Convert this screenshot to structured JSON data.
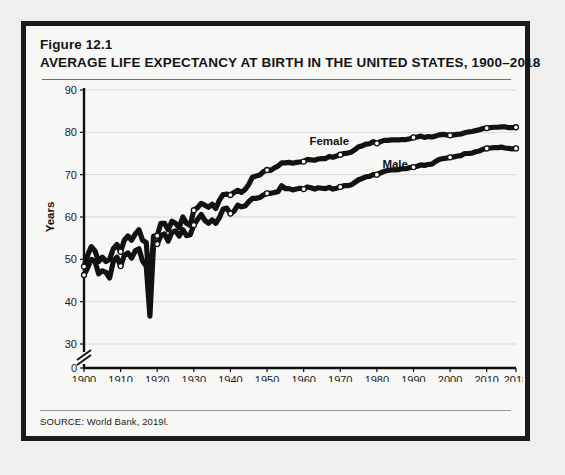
{
  "figure": {
    "number": "Figure 12.1",
    "title": "AVERAGE LIFE EXPECTANCY AT BIRTH IN THE UNITED STATES, 1900–2018",
    "source": "SOURCE: World Bank, 2019l.",
    "border_color": "#1b1b1b",
    "background_color": "#f7f7f6"
  },
  "chart_data": {
    "type": "line",
    "title": "AVERAGE LIFE EXPECTANCY AT BIRTH IN THE UNITED STATES, 1900–2018",
    "xlabel": "",
    "ylabel": "Years",
    "xlim": [
      1900,
      2018
    ],
    "ylim": [
      30,
      90
    ],
    "y_axis_break": true,
    "y_break_between": [
      0,
      30
    ],
    "grid": "horizontal",
    "legend": "inline-labels",
    "line_color": "#121212",
    "marker_color": "#ffffff",
    "xticks": [
      1900,
      1910,
      1920,
      1930,
      1940,
      1950,
      1960,
      1970,
      1980,
      1990,
      2000,
      2010,
      2018
    ],
    "xtick_labels": [
      "1900",
      "1910",
      "1920",
      "1930",
      "1940",
      "1950",
      "1960",
      "1970",
      "1980",
      "1990",
      "2000",
      "2010",
      "2018"
    ],
    "yticks": [
      0,
      30,
      40,
      50,
      60,
      70,
      80,
      90
    ],
    "ytick_labels": [
      "0",
      "30",
      "40",
      "50",
      "60",
      "70",
      "80",
      "90"
    ],
    "x": [
      1900,
      1901,
      1902,
      1903,
      1904,
      1905,
      1906,
      1907,
      1908,
      1909,
      1910,
      1911,
      1912,
      1913,
      1914,
      1915,
      1916,
      1917,
      1918,
      1919,
      1920,
      1921,
      1922,
      1923,
      1924,
      1925,
      1926,
      1927,
      1928,
      1929,
      1930,
      1931,
      1932,
      1933,
      1934,
      1935,
      1936,
      1937,
      1938,
      1939,
      1940,
      1941,
      1942,
      1943,
      1944,
      1945,
      1946,
      1947,
      1948,
      1949,
      1950,
      1951,
      1952,
      1953,
      1954,
      1955,
      1956,
      1957,
      1958,
      1959,
      1960,
      1961,
      1962,
      1963,
      1964,
      1965,
      1966,
      1967,
      1968,
      1969,
      1970,
      1971,
      1972,
      1973,
      1974,
      1975,
      1976,
      1977,
      1978,
      1979,
      1980,
      1981,
      1982,
      1983,
      1984,
      1985,
      1986,
      1987,
      1988,
      1989,
      1990,
      1991,
      1992,
      1993,
      1994,
      1995,
      1996,
      1997,
      1998,
      1999,
      2000,
      2001,
      2002,
      2003,
      2004,
      2005,
      2006,
      2007,
      2008,
      2009,
      2010,
      2011,
      2012,
      2013,
      2014,
      2015,
      2016,
      2017,
      2018
    ],
    "series": [
      {
        "name": "Female",
        "label": "Female",
        "label_x": 1967,
        "label_y": 77.0,
        "values": [
          48.3,
          51.0,
          53.0,
          52.0,
          49.5,
          50.5,
          49.5,
          50.0,
          52.5,
          53.5,
          51.8,
          54.5,
          55.5,
          54.5,
          56.0,
          57.0,
          54.5,
          54.0,
          42.2,
          55.5,
          55.6,
          58.5,
          58.5,
          57.0,
          59.0,
          58.5,
          57.5,
          60.0,
          58.5,
          58.0,
          61.6,
          62.2,
          63.2,
          62.8,
          62.3,
          63.0,
          62.0,
          64.0,
          65.3,
          65.4,
          65.2,
          65.8,
          66.3,
          65.8,
          66.5,
          67.7,
          69.4,
          69.7,
          69.9,
          70.7,
          71.1,
          71.0,
          71.6,
          72.0,
          72.8,
          72.8,
          72.9,
          72.7,
          72.9,
          73.0,
          73.1,
          73.6,
          73.5,
          73.4,
          73.7,
          73.8,
          73.8,
          74.3,
          74.1,
          74.4,
          74.7,
          75.0,
          75.1,
          75.3,
          75.9,
          76.6,
          76.8,
          77.2,
          77.3,
          77.8,
          77.4,
          77.8,
          78.1,
          78.1,
          78.2,
          78.2,
          78.2,
          78.3,
          78.3,
          78.5,
          78.8,
          78.9,
          79.1,
          78.8,
          79.0,
          78.9,
          79.1,
          79.4,
          79.5,
          79.4,
          79.3,
          79.4,
          79.5,
          79.6,
          79.9,
          80.1,
          80.2,
          80.4,
          80.6,
          80.9,
          81.0,
          81.1,
          81.2,
          81.2,
          81.3,
          81.3,
          81.1,
          81.1,
          81.2
        ]
      },
      {
        "name": "Male",
        "label": "Male",
        "label_x": 1985,
        "label_y": 71.5,
        "values": [
          46.3,
          48.0,
          50.0,
          49.5,
          46.6,
          47.3,
          46.9,
          45.6,
          49.5,
          50.5,
          48.4,
          50.9,
          51.5,
          50.3,
          52.0,
          52.5,
          49.6,
          48.4,
          36.6,
          53.5,
          53.6,
          55.6,
          56.0,
          54.3,
          56.4,
          56.7,
          55.5,
          57.0,
          55.6,
          55.8,
          58.1,
          59.4,
          60.6,
          59.2,
          58.5,
          59.3,
          58.5,
          59.9,
          61.9,
          62.1,
          60.8,
          61.4,
          62.8,
          62.4,
          62.6,
          63.6,
          64.4,
          64.4,
          64.6,
          65.2,
          65.6,
          65.6,
          65.8,
          66.0,
          67.4,
          66.7,
          66.7,
          66.4,
          66.6,
          66.8,
          66.6,
          67.1,
          66.9,
          66.6,
          66.9,
          66.8,
          66.7,
          67.0,
          66.6,
          66.8,
          67.1,
          67.4,
          67.4,
          67.6,
          68.2,
          68.8,
          69.1,
          69.5,
          69.6,
          70.0,
          70.0,
          70.4,
          70.8,
          71.0,
          71.1,
          71.1,
          71.2,
          71.4,
          71.4,
          71.7,
          71.8,
          72.0,
          72.3,
          72.2,
          72.4,
          72.5,
          73.1,
          73.6,
          73.8,
          73.9,
          74.1,
          74.2,
          74.4,
          74.5,
          75.0,
          75.0,
          75.1,
          75.4,
          75.6,
          76.0,
          76.2,
          76.3,
          76.4,
          76.4,
          76.5,
          76.3,
          76.2,
          76.1,
          76.2
        ]
      }
    ],
    "annotations": [
      {
        "year": 1918,
        "note": "influenza pandemic dip"
      }
    ]
  }
}
